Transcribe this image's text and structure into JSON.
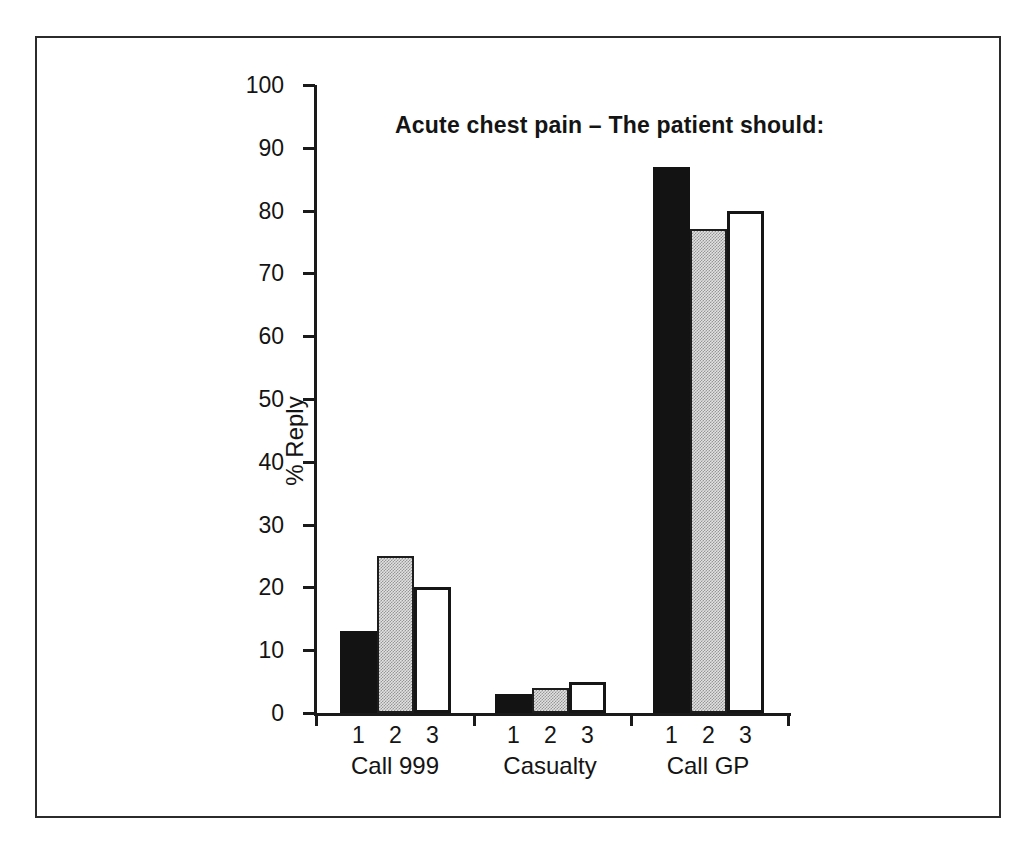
{
  "chart_data": {
    "type": "bar",
    "title": "Acute chest pain – The patient should:",
    "xlabel": "",
    "ylabel": "% Reply",
    "ylim": [
      0,
      100
    ],
    "yticks": [
      0,
      10,
      20,
      30,
      40,
      50,
      60,
      70,
      80,
      90,
      100
    ],
    "categories": [
      "Call 999",
      "Casualty",
      "Call GP"
    ],
    "series": [
      {
        "name": "1",
        "style": "solid-black",
        "values": [
          13,
          3,
          87
        ]
      },
      {
        "name": "2",
        "style": "stippled-gray",
        "values": [
          25,
          4,
          77
        ]
      },
      {
        "name": "3",
        "style": "white-outline",
        "values": [
          20,
          5,
          80
        ]
      }
    ],
    "grid": false,
    "legend": "none"
  },
  "colors": {
    "bar_black": "#131313",
    "bar_gray_base": "#e2e2e2",
    "bar_gray_dot": "#969696",
    "bar_white": "#ffffff",
    "axis": "#1a1a1a",
    "frame": "#2b2b2b",
    "background": "#ffffff",
    "text": "#141414"
  }
}
